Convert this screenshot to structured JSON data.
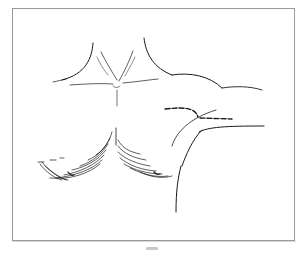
{
  "figure": {
    "type": "line-drawing",
    "caption": "",
    "stroke_color": "#1a1a1a",
    "frame_color": "#9a9a9a",
    "incisions": [
      {
        "name": "upper-dashed-incision",
        "style": "dashed"
      },
      {
        "name": "lower-dashed-incision",
        "style": "dashed"
      }
    ]
  }
}
